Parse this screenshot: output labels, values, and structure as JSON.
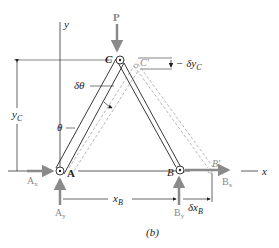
{
  "figure": {
    "caption": "(b)",
    "axes": {
      "x_label": "x",
      "y_label": "y"
    },
    "points": {
      "A": "A",
      "B": "B",
      "C": "C",
      "B_prime": "B′",
      "C_prime": "C′"
    },
    "forces": {
      "P": "P",
      "Ax": {
        "main": "A",
        "sub": "x"
      },
      "Ay": {
        "main": "A",
        "sub": "y"
      },
      "Bx": {
        "main": "B",
        "sub": "x"
      },
      "By": {
        "main": "B",
        "sub": "y"
      }
    },
    "dimensions": {
      "yC": {
        "main": "y",
        "sub": "C"
      },
      "xB": {
        "main": "x",
        "sub": "B"
      },
      "delta_xB": {
        "main": "δx",
        "sub": "B"
      },
      "delta_yC": {
        "main": "− δy",
        "sub": "C"
      }
    },
    "angles": {
      "theta": "θ",
      "delta_theta": "δθ"
    },
    "colors": {
      "ink": "#222222",
      "force_gray": "#8a8a8a",
      "dashed_gray": "#9a9a9a"
    }
  }
}
